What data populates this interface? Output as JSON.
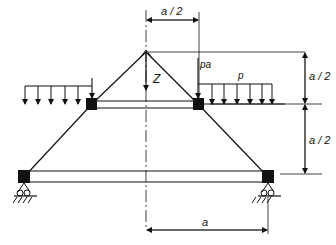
{
  "figure": {
    "type": "structural-mechanics diagram",
    "colors": {
      "line": "#111111",
      "background": "#ffffff"
    }
  },
  "labels": {
    "top_dimension": "a / 2",
    "right_upper_dimension": "a / 2",
    "right_lower_dimension": "a / 2",
    "bottom_dimension": "a",
    "apex_load": "Z",
    "point_load": "pa",
    "distributed_load": "p"
  },
  "elements": {
    "apex_node": "pin joint at top",
    "upper_beam": "horizontal beam between upper nodes",
    "lower_beam": "horizontal beam between supports",
    "supports": [
      "roller support left",
      "roller support right"
    ],
    "center_axis": "dash-dot symmetry axis"
  }
}
